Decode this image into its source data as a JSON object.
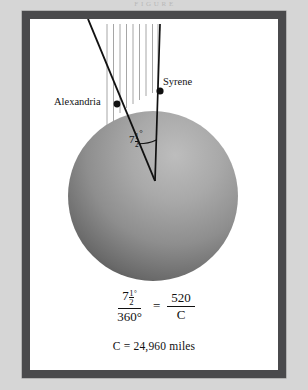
{
  "page": {
    "top_caption": "F I G U R E",
    "background_color": "#d6d6d6",
    "frame_color": "#4a4a4c",
    "plate_color": "#ffffff"
  },
  "diagram": {
    "sphere": {
      "label": "earth-sphere",
      "center_x": 153,
      "center_y": 196,
      "radius": 85,
      "light_color": "#b6b6b6",
      "dark_color": "#3a3a3a"
    },
    "sun_rays": {
      "label": "parallel-sun-rays",
      "count": 9,
      "color": "#9a9a9a",
      "x_start": 106,
      "x_end": 160,
      "y_top": 24,
      "orientation": "vertical"
    },
    "points": [
      {
        "name": "Alexandria",
        "label": "Alexandria",
        "x": 117,
        "y": 104,
        "label_x": 54,
        "label_y": 96
      },
      {
        "name": "Syrene",
        "label": "Syrene",
        "x": 160,
        "y": 91,
        "label_x": 163,
        "label_y": 76
      }
    ],
    "angle": {
      "name": "central-angle",
      "whole": "7",
      "numerator": "1",
      "denominator": "2",
      "degree_symbol": "°",
      "value_degrees": 7.5,
      "vertex_x": 155,
      "vertex_y": 181
    }
  },
  "equation": {
    "left_fraction": {
      "numerator_whole": "7",
      "numerator_num": "1",
      "numerator_den": "2",
      "numerator_degree": "°",
      "denominator": "360°"
    },
    "operator": "=",
    "right_fraction": {
      "numerator": "520",
      "denominator": "C"
    }
  },
  "result": {
    "text": "C = 24,960 miles",
    "variable": "C",
    "value": "24,960",
    "unit": "miles"
  }
}
